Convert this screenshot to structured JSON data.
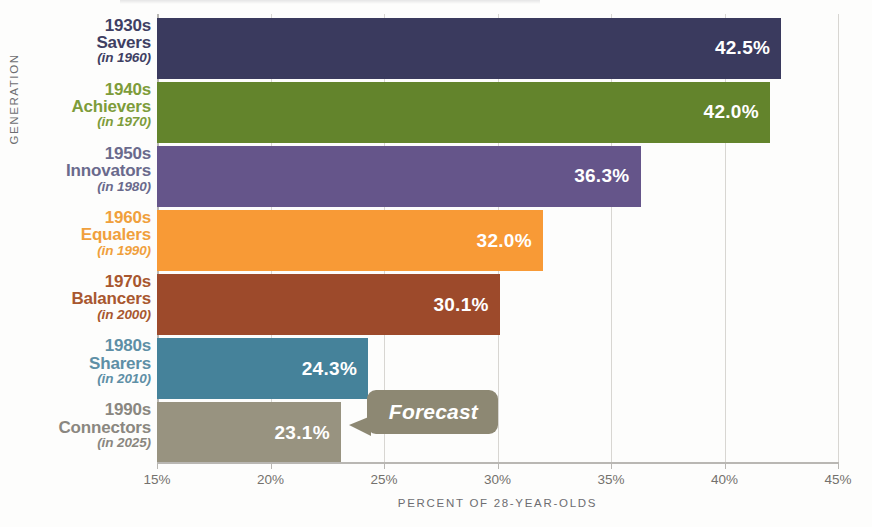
{
  "chart_data": {
    "type": "bar",
    "orientation": "horizontal",
    "title": "",
    "xlabel": "PERCENT OF 28-YEAR-OLDS",
    "ylabel": "GENERATION",
    "xlim": [
      15,
      45
    ],
    "xticks": [
      "15%",
      "20%",
      "25%",
      "30%",
      "35%",
      "40%",
      "45%"
    ],
    "xtick_values": [
      15,
      20,
      25,
      30,
      35,
      40,
      45
    ],
    "grid": true,
    "legend": "none",
    "categories": [
      "1930s Savers (in 1960)",
      "1940s Achievers (in 1970)",
      "1950s Innovators (in 1980)",
      "1960s Equalers (in 1990)",
      "1970s Balancers (in 2000)",
      "1980s Sharers (in 2010)",
      "1990s Connectors (in 2025)"
    ],
    "values": [
      42.5,
      42.0,
      36.3,
      32.0,
      30.1,
      24.3,
      23.1
    ],
    "value_labels": [
      "42.5%",
      "42.0%",
      "36.3%",
      "32.0%",
      "30.1%",
      "24.3%",
      "23.1%"
    ],
    "annotations": [
      {
        "text": "Forecast",
        "target_category": "1990s Connectors (in 2025)"
      }
    ]
  },
  "bars": [
    {
      "decade": "1930s",
      "name": "Savers",
      "year": "(in 1960)",
      "value_label": "42.5%",
      "value": 42.5,
      "color": "#3a3a5e",
      "label_color": "#3f3f63"
    },
    {
      "decade": "1940s",
      "name": "Achievers",
      "year": "(in 1970)",
      "value_label": "42.0%",
      "value": 42.0,
      "color": "#63842c",
      "label_color": "#7d9c3a"
    },
    {
      "decade": "1950s",
      "name": "Innovators",
      "year": "(in 1980)",
      "value_label": "36.3%",
      "value": 36.3,
      "color": "#65558a",
      "label_color": "#6a6a8c"
    },
    {
      "decade": "1960s",
      "name": "Equalers",
      "year": "(in 1990)",
      "value_label": "32.0%",
      "value": 32.0,
      "color": "#f89a36",
      "label_color": "#f0a03c"
    },
    {
      "decade": "1970s",
      "name": "Balancers",
      "year": "(in 2000)",
      "value_label": "30.1%",
      "value": 30.1,
      "color": "#9d4a2b",
      "label_color": "#a8572f"
    },
    {
      "decade": "1980s",
      "name": "Sharers",
      "year": "(in 2010)",
      "value_label": "24.3%",
      "value": 24.3,
      "color": "#45829a",
      "label_color": "#5e8fa6"
    },
    {
      "decade": "1990s",
      "name": "Connectors",
      "year": "(in 2025)",
      "value_label": "23.1%",
      "value": 23.1,
      "color": "#989380",
      "label_color": "#8a8780"
    }
  ],
  "axes": {
    "y_title": "GENERATION",
    "x_title": "PERCENT OF 28-YEAR-OLDS",
    "x_ticks": [
      "15%",
      "20%",
      "25%",
      "30%",
      "35%",
      "40%",
      "45%"
    ]
  },
  "annotation": {
    "forecast_label": "Forecast",
    "color": "#8d8873"
  }
}
